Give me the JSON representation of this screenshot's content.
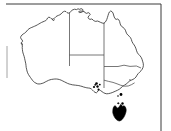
{
  "figure": {
    "caption": "Outline map of Australia with state and territory borders; shaded range shown in solid black.",
    "width_px": 171,
    "height_px": 131,
    "background_color": "#ffffff"
  },
  "frame": {
    "name": "partial-plot-frame",
    "top_rule_color": "#3a3a3a",
    "right_rule_color": "#3a3a3a",
    "left_rule_color": "#9a9a9a",
    "top_y": 4,
    "right_x": 161,
    "left_x": 7
  },
  "map": {
    "name": "australia-outline",
    "coast_stroke": "#2b2b2b",
    "land_fill": "#ffffff",
    "border_stroke": "#4a4a4a",
    "regions": [
      {
        "id": "wa",
        "label": "Western Australia"
      },
      {
        "id": "nt",
        "label": "Northern Territory"
      },
      {
        "id": "sa",
        "label": "South Australia"
      },
      {
        "id": "qld",
        "label": "Queensland"
      },
      {
        "id": "nsw",
        "label": "New South Wales"
      },
      {
        "id": "vic",
        "label": "Victoria"
      },
      {
        "id": "tas",
        "label": "Tasmania"
      }
    ]
  },
  "distribution": {
    "name": "species-range",
    "shaded_color": "#000000",
    "shaded_regions": [
      {
        "id": "tas",
        "label": "Tasmania",
        "fill": "#000000"
      }
    ],
    "point_records": [
      {
        "id": "rec-1",
        "label": "Fleurieu Peninsula",
        "x": 96.5,
        "y": 83.5,
        "r": 1.3
      },
      {
        "id": "rec-2",
        "label": "Kangaroo Island",
        "x": 94.0,
        "y": 87.0,
        "r": 1.1
      },
      {
        "id": "rec-3",
        "label": "Mount Lofty Ranges",
        "x": 97.5,
        "y": 86.5,
        "r": 1.2
      },
      {
        "id": "rec-4",
        "label": "Coorong",
        "x": 98.5,
        "y": 89.5,
        "r": 1.0
      },
      {
        "id": "rec-5",
        "label": "Wilsons Promontory",
        "x": 121.0,
        "y": 94.5,
        "r": 1.4
      },
      {
        "id": "rec-6",
        "label": "Bass Strait island",
        "x": 122.5,
        "y": 103.5,
        "r": 1.2
      }
    ]
  }
}
